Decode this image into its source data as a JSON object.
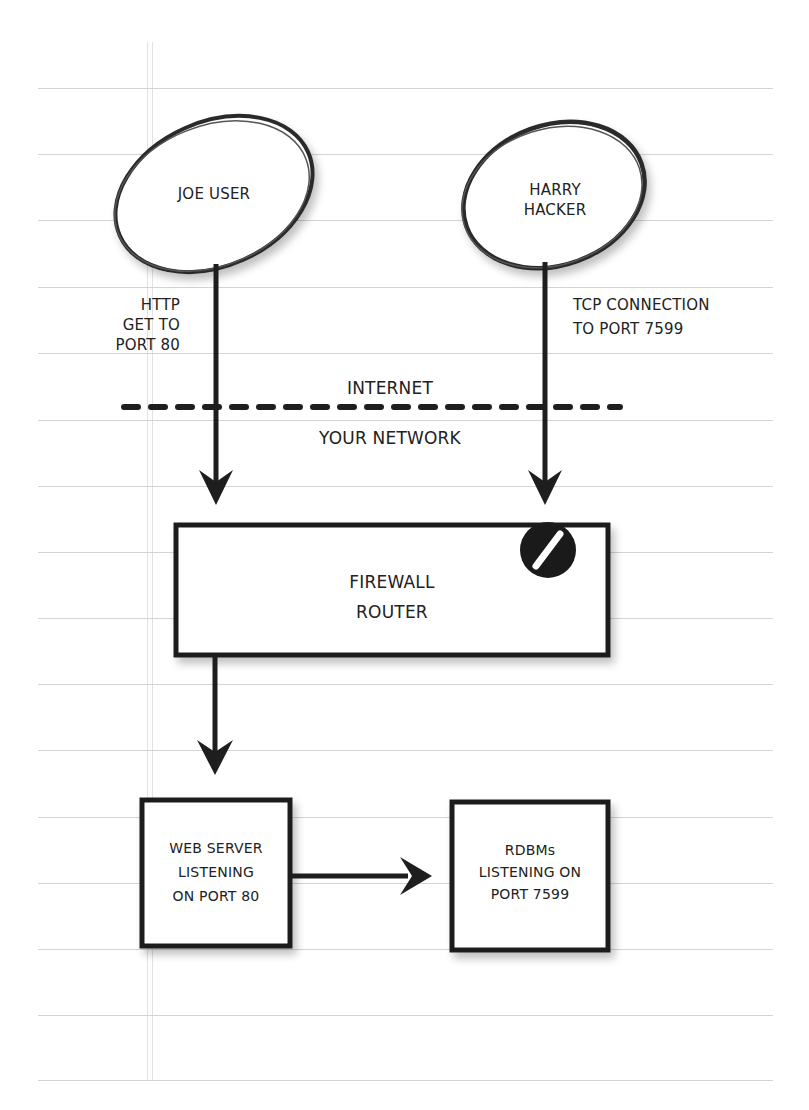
{
  "diagram": {
    "type": "network-flow",
    "nodes": {
      "joe_user": {
        "label": "JOE USER",
        "shape": "ellipse"
      },
      "harry_hacker": {
        "label_line1": "HARRY",
        "label_line2": "HACKER",
        "shape": "ellipse"
      },
      "firewall": {
        "label_line1": "FIREWALL",
        "label_line2": "ROUTER",
        "shape": "rectangle",
        "badge": "no-entry-icon"
      },
      "web_server": {
        "label_line1": "WEB SERVER",
        "label_line2": "LISTENING",
        "label_line3": "ON PORT 80",
        "shape": "rectangle"
      },
      "rdbms": {
        "label_line1": "RDBMs",
        "label_line2": "LISTENING ON",
        "label_line3": "PORT 7599",
        "shape": "rectangle"
      }
    },
    "edges": {
      "joe_to_firewall": {
        "line1": "HTTP",
        "line2": "GET TO",
        "line3": "PORT 80"
      },
      "harry_to_firewall": {
        "line1": "TCP CONNECTION",
        "line2": "TO PORT 7599",
        "blocked": true
      },
      "firewall_to_web": {},
      "web_to_rdbms": {}
    },
    "boundary": {
      "above": "INTERNET",
      "below": "YOUR NETWORK",
      "style": "dashed"
    }
  },
  "colors": {
    "ink": "#1e1e1e",
    "paper": "#ffffff",
    "rule": "#d4d4d4"
  }
}
